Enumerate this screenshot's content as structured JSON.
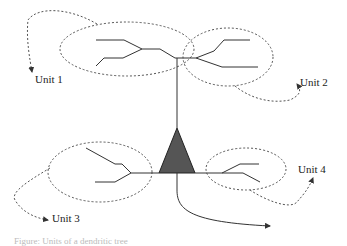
{
  "diagram": {
    "type": "neuron-dendrite-units",
    "labels": {
      "unit1": "Unit 1",
      "unit2": "Unit 2",
      "unit3": "Unit 3",
      "unit4": "Unit 4"
    },
    "colors": {
      "soma_fill": "#555555",
      "line": "#333333",
      "dashed": "#555555"
    },
    "caption": "Figure: Units of a dendritic tree"
  }
}
